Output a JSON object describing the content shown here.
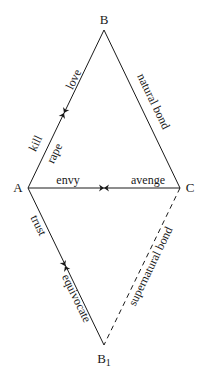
{
  "diagram": {
    "vertices": {
      "A": {
        "label": "A"
      },
      "B": {
        "label": "B"
      },
      "C": {
        "label": "C"
      },
      "B1": {
        "label": "B",
        "subscript": "1"
      }
    },
    "edges": {
      "AB": {
        "labels_outer": [
          "love",
          "kill"
        ],
        "labels_inner": [
          "rape"
        ],
        "style": "solid"
      },
      "BC": {
        "labels": [
          "natural bond"
        ],
        "style": "solid"
      },
      "AC": {
        "labels": [
          "envy",
          "avenge"
        ],
        "style": "solid"
      },
      "AB1": {
        "labels": [
          "trust",
          "equivocate"
        ],
        "style": "solid"
      },
      "CB1": {
        "labels": [
          "supernatural bond"
        ],
        "style": "dashed"
      }
    },
    "colors": {
      "stroke": "#1a1a1a",
      "background": "#ffffff"
    }
  }
}
